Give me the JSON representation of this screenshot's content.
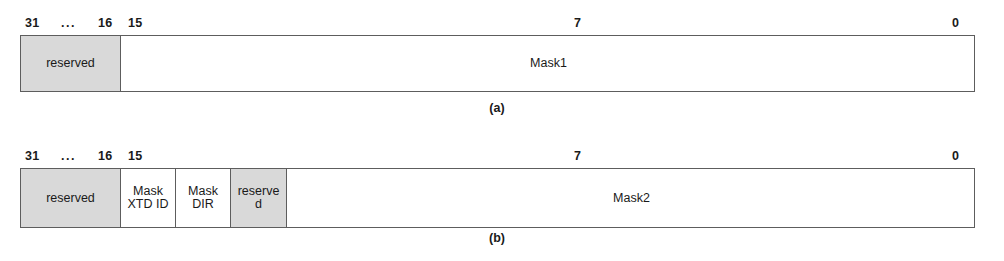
{
  "figure": {
    "diagrams": [
      {
        "id": "diagram-a",
        "caption": "(a)",
        "bit_labels": [
          {
            "text": "31",
            "x": 25,
            "name": "bit-label-31"
          },
          {
            "text": "...",
            "x": 61,
            "name": "bit-label-ellipsis"
          },
          {
            "text": "16",
            "x": 98,
            "name": "bit-label-16"
          },
          {
            "text": "15",
            "x": 128,
            "name": "bit-label-15"
          },
          {
            "text": "7",
            "x": 574,
            "name": "bit-label-7"
          },
          {
            "text": "0",
            "x": 952,
            "name": "bit-label-0"
          }
        ],
        "fields": [
          {
            "label": "reserved",
            "width": 100,
            "shaded": true,
            "name": "field-reserved"
          },
          {
            "label": "Mask1",
            "width": 855,
            "shaded": false,
            "name": "field-mask1"
          }
        ],
        "tick_count": 15
      },
      {
        "id": "diagram-b",
        "caption": "(b)",
        "bit_labels": [
          {
            "text": "31",
            "x": 25,
            "name": "bit-label-31"
          },
          {
            "text": "...",
            "x": 61,
            "name": "bit-label-ellipsis"
          },
          {
            "text": "16",
            "x": 98,
            "name": "bit-label-16"
          },
          {
            "text": "15",
            "x": 128,
            "name": "bit-label-15"
          },
          {
            "text": "7",
            "x": 574,
            "name": "bit-label-7"
          },
          {
            "text": "0",
            "x": 952,
            "name": "bit-label-0"
          }
        ],
        "fields": [
          {
            "label": "reserved",
            "width": 100,
            "shaded": true,
            "name": "field-reserved"
          },
          {
            "label": "Mask\nXTD ID",
            "width": 55,
            "shaded": false,
            "name": "field-mask-xtd-id"
          },
          {
            "label": "Mask\nDIR",
            "width": 55,
            "shaded": false,
            "name": "field-mask-dir"
          },
          {
            "label": "reserve\nd",
            "width": 56,
            "shaded": true,
            "name": "field-reserved-2"
          },
          {
            "label": "Mask2",
            "width": 689,
            "shaded": false,
            "name": "field-mask2"
          }
        ],
        "tick_count": 15
      }
    ],
    "colors": {
      "shaded_fill": "#d9d9d9",
      "border": "#5d5d5d",
      "tick": "#3d3d3d",
      "text": "#1a1a1a",
      "background": "#ffffff"
    },
    "geometry": {
      "box_left": 20,
      "box_width": 955,
      "scale_start_x": 120,
      "scale_end_x": 975,
      "cell_count": 16,
      "diagram_a_box_top": 35,
      "diagram_a_box_height": 57,
      "diagram_a_scale_top": 15,
      "diagram_a_caption_top": 101,
      "diagram_b_box_top": 168,
      "diagram_b_box_height": 60,
      "diagram_b_scale_top": 148,
      "diagram_b_caption_top": 231,
      "caption_center_x": 497
    }
  }
}
